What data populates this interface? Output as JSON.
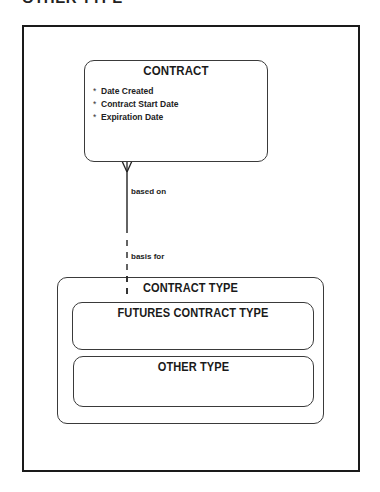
{
  "page": {
    "clipped_heading": "OTHER TYPE"
  },
  "entities": {
    "contract": {
      "title": "CONTRACT",
      "attributes": [
        {
          "marker": "*",
          "name": "Date Created"
        },
        {
          "marker": "*",
          "name": "Contract Start Date"
        },
        {
          "marker": "*",
          "name": "Expiration Date"
        }
      ]
    },
    "contract_type": {
      "title": "CONTRACT TYPE",
      "subtypes": [
        {
          "title": "FUTURES CONTRACT TYPE"
        },
        {
          "title": "OTHER TYPE"
        }
      ]
    }
  },
  "relationship": {
    "from_entity": "CONTRACT",
    "to_entity": "CONTRACT TYPE",
    "from_label": "based on",
    "to_label": "basis for",
    "from_cardinality": "many (crow's foot), mandatory (solid)",
    "to_cardinality": "one, optional (dashed)"
  }
}
